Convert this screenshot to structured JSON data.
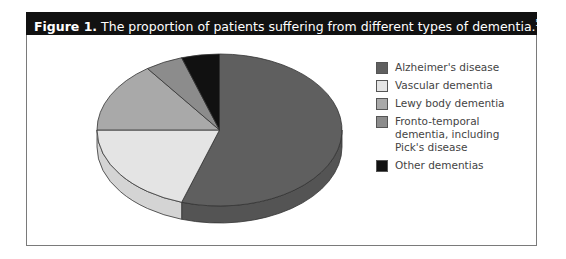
{
  "figure": {
    "label": "Figure 1.",
    "caption": " The proportion of patients suffering from different types of dementia.",
    "reference": "5"
  },
  "chart_data": {
    "type": "pie",
    "style": "3d",
    "title": "Figure 1. The proportion of patients suffering from different types of dementia.",
    "categories": [
      "Alzheimer's disease",
      "Vascular dementia",
      "Lewy body dementia",
      "Fronto-temporal dementia, including Pick's disease",
      "Other dementias"
    ],
    "values": [
      55,
      20,
      15,
      5,
      5
    ],
    "unit": "%",
    "start_angle": "12 o'clock",
    "direction": "clockwise",
    "legend_position": "right",
    "colors": [
      "#5f5f5f",
      "#e4e4e4",
      "#a9a9a9",
      "#8c8c8c",
      "#111111"
    ]
  },
  "legend": {
    "items": [
      {
        "label": "Alzheimer's disease",
        "color": "#5f5f5f"
      },
      {
        "label": "Vascular dementia",
        "color": "#e4e4e4"
      },
      {
        "label": "Lewy body dementia",
        "color": "#a9a9a9"
      },
      {
        "label": "Fronto-temporal dementia, including Pick's disease",
        "color": "#8c8c8c"
      },
      {
        "label": "Other dementias",
        "color": "#111111"
      }
    ]
  }
}
